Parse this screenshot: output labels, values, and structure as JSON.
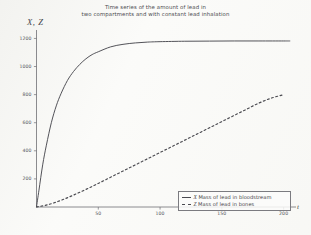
{
  "chart_data": {
    "type": "line",
    "title": "Time series of the amount of lead in two compartments and with constant lead inhalation",
    "title_lines": [
      "Time series of the amount of lead in",
      "two compartments and with constant lead inhalation"
    ],
    "xlabel": "t",
    "ylabel": "X, Z",
    "xlim": [
      0,
      210
    ],
    "ylim": [
      0,
      1260
    ],
    "xticks": [
      50,
      100,
      150,
      200
    ],
    "yticks": [
      200,
      400,
      600,
      800,
      1000,
      1200
    ],
    "grid": false,
    "legend_position": "bottom-right",
    "series": [
      {
        "name": "X Mass of lead in bloodstream",
        "symbol": "X",
        "label": "Mass of lead in bloodstream",
        "style": "solid",
        "color": "#4a4a50",
        "x": [
          0,
          2,
          5,
          8,
          12,
          16,
          20,
          25,
          30,
          35,
          40,
          45,
          50,
          60,
          70,
          80,
          90,
          100,
          120,
          140,
          160,
          180,
          200,
          205
        ],
        "y": [
          0,
          120,
          300,
          440,
          600,
          720,
          810,
          900,
          965,
          1015,
          1055,
          1085,
          1105,
          1140,
          1158,
          1168,
          1174,
          1177,
          1180,
          1181,
          1182,
          1182,
          1182,
          1182
        ]
      },
      {
        "name": "Z Mass of lead in bones",
        "symbol": "Z",
        "label": "Mass of lead in bones",
        "style": "dashed",
        "color": "#4a4a50",
        "x": [
          0,
          10,
          20,
          30,
          40,
          50,
          60,
          70,
          80,
          90,
          100,
          110,
          120,
          130,
          140,
          150,
          160,
          170,
          180,
          190,
          200
        ],
        "y": [
          0,
          18,
          48,
          85,
          125,
          168,
          212,
          256,
          300,
          344,
          388,
          432,
          476,
          520,
          564,
          608,
          652,
          696,
          740,
          775,
          800
        ]
      }
    ]
  },
  "legend": {
    "entries": [
      {
        "symbol": "X",
        "label": "Mass of lead in bloodstream",
        "style": "solid"
      },
      {
        "symbol": "Z",
        "label": "Mass of lead in bones",
        "style": "dashed"
      }
    ]
  },
  "axes": {
    "ytick_labels": [
      "1200",
      "1000",
      "800",
      "600",
      "400",
      "200"
    ],
    "xtick_labels": [
      "50",
      "100",
      "150",
      "200"
    ],
    "y_axis_title": "X, Z",
    "x_axis_title": "t"
  }
}
